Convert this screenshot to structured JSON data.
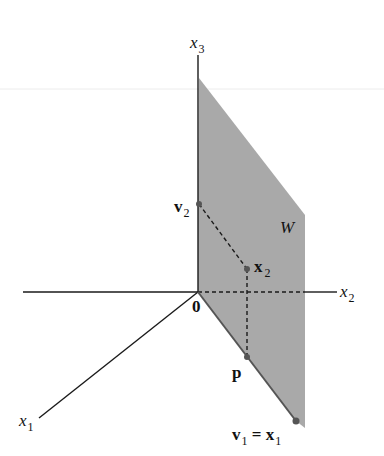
{
  "diagram": {
    "axes": {
      "x1": {
        "label": "x",
        "sub": "1"
      },
      "x2": {
        "label": "x",
        "sub": "2"
      },
      "x3": {
        "label": "x",
        "sub": "3"
      }
    },
    "origin_label": "0",
    "plane_label": "W",
    "points": {
      "v2": {
        "label": "v",
        "sub": "2"
      },
      "x2": {
        "label": "x",
        "sub": "2"
      },
      "p": {
        "label": "p"
      },
      "v1": {
        "label": "v",
        "sub": "1",
        "eq": " = ",
        "label2": "x",
        "sub2": "1"
      }
    },
    "colors": {
      "plane": "#a9a9a9",
      "axis": "#1a1a1a",
      "points": "#555555"
    }
  }
}
